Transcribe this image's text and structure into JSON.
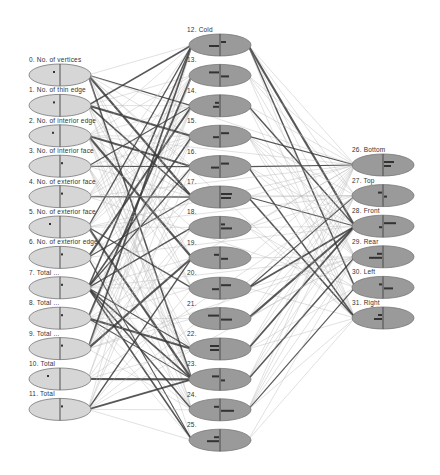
{
  "diagram": {
    "type": "bayesian-network",
    "colors": {
      "input_node_fill": "#d6d6d6",
      "hidden_node_fill": "#9a9a9a",
      "output_node_fill": "#9a9a9a",
      "node_stroke": "#777777",
      "edge_dark": "#3a3a3a",
      "edge_light": "#b5b5b5"
    },
    "layers": [
      {
        "name": "input",
        "nodes": [
          {
            "id": 0,
            "label": "0. No. of vertices"
          },
          {
            "id": 1,
            "label": "1. No. of thin edge"
          },
          {
            "id": 2,
            "label": "2. No. of interior edge"
          },
          {
            "id": 3,
            "label": "3. No. of interior face"
          },
          {
            "id": 4,
            "label": "4. No. of exterior face"
          },
          {
            "id": 5,
            "label": "5. No. of exterior face"
          },
          {
            "id": 6,
            "label": "6. No. of exterior edge"
          },
          {
            "id": 7,
            "label": "7. Total ..."
          },
          {
            "id": 8,
            "label": "8. Total ..."
          },
          {
            "id": 9,
            "label": "9. Total ..."
          },
          {
            "id": 10,
            "label": "10. Total"
          },
          {
            "id": 11,
            "label": "11. Total"
          }
        ]
      },
      {
        "name": "hidden",
        "nodes": [
          {
            "id": 12,
            "label": "12. Cold"
          },
          {
            "id": 13,
            "label": "13."
          },
          {
            "id": 14,
            "label": "14."
          },
          {
            "id": 15,
            "label": "15."
          },
          {
            "id": 16,
            "label": "16."
          },
          {
            "id": 17,
            "label": "17."
          },
          {
            "id": 18,
            "label": "18."
          },
          {
            "id": 19,
            "label": "19."
          },
          {
            "id": 20,
            "label": "20."
          },
          {
            "id": 21,
            "label": "21."
          },
          {
            "id": 22,
            "label": "22."
          },
          {
            "id": 23,
            "label": "23."
          },
          {
            "id": 24,
            "label": "24."
          },
          {
            "id": 25,
            "label": "25."
          }
        ]
      },
      {
        "name": "output",
        "nodes": [
          {
            "id": 26,
            "label": "26. Bottom"
          },
          {
            "id": 27,
            "label": "27. Top"
          },
          {
            "id": 28,
            "label": "28. Front"
          },
          {
            "id": 29,
            "label": "29. Rear"
          },
          {
            "id": 30,
            "label": "30. Left"
          },
          {
            "id": 31,
            "label": "31. Right"
          }
        ]
      }
    ]
  }
}
